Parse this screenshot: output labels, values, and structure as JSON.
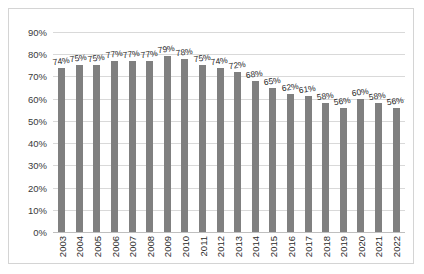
{
  "chart_data": {
    "type": "bar",
    "title": "",
    "subtitle": "",
    "xlabel": "",
    "ylabel": "",
    "ylim": [
      0,
      90
    ],
    "grid": true,
    "legend": false,
    "legend_position": "none",
    "bar_color": "#808080",
    "gridline_color": "#d9d9d9",
    "border_color": "#d4d4d4",
    "value_suffix": "%",
    "categories": [
      "2003",
      "2004",
      "2005",
      "2006",
      "2007",
      "2008",
      "2009",
      "2010",
      "2011",
      "2012",
      "2013",
      "2014",
      "2015",
      "2016",
      "2017",
      "2018",
      "2019",
      "2020",
      "2021",
      "2022"
    ],
    "values": [
      74,
      75,
      75,
      77,
      77,
      77,
      79,
      78,
      75,
      74,
      72,
      68,
      65,
      62,
      61,
      58,
      56,
      60,
      58,
      56
    ],
    "data_labels": [
      "74%",
      "75%",
      "75%",
      "77%",
      "77%",
      "77%",
      "79%",
      "78%",
      "75%",
      "74%",
      "72%",
      "68%",
      "65%",
      "62%",
      "61%",
      "58%",
      "56%",
      "60%",
      "58%",
      "56%"
    ],
    "yticks": [
      0,
      10,
      20,
      30,
      40,
      50,
      60,
      70,
      80,
      90
    ],
    "ytick_labels": [
      "0%",
      "10%",
      "20%",
      "30%",
      "40%",
      "50%",
      "60%",
      "70%",
      "80%",
      "90%"
    ]
  }
}
